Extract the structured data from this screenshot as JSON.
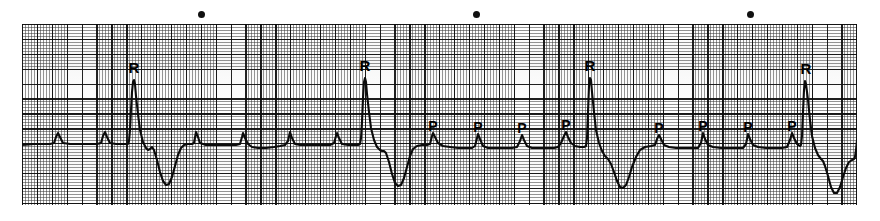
{
  "figure": {
    "kind": "ecg-rhythm-strip",
    "width": 880,
    "height": 221,
    "paper": {
      "x": 22,
      "y": 24,
      "width": 835,
      "height": 181
    },
    "trace_color": "#0b0b0b",
    "grid_fine_color": "#3c3c3c",
    "grid_bold_color": "#0a0a0a",
    "paper_color": "#ffffff",
    "baseline_y": 143,
    "small_square_px": 2.98,
    "large_square_px": 14.9
  },
  "timing_markers": [
    {
      "name": "timing-dot-1",
      "x": 201,
      "y": 14,
      "size": 7
    },
    {
      "name": "timing-dot-2",
      "x": 476,
      "y": 14,
      "size": 7
    },
    {
      "name": "timing-dot-3",
      "x": 750,
      "y": 14,
      "size": 7
    }
  ],
  "annotations": [
    {
      "id": "r1",
      "text": "R",
      "x": 134,
      "y": 60,
      "kind": "r-wave"
    },
    {
      "id": "r2",
      "text": "R",
      "x": 365,
      "y": 58,
      "kind": "r-wave"
    },
    {
      "id": "r3",
      "text": "R",
      "x": 590,
      "y": 58,
      "kind": "r-wave"
    },
    {
      "id": "r4",
      "text": "R",
      "x": 806,
      "y": 61,
      "kind": "r-wave"
    },
    {
      "id": "p1",
      "text": "P",
      "x": 433,
      "y": 119,
      "kind": "p-wave"
    },
    {
      "id": "p2",
      "text": "P",
      "x": 478,
      "y": 120,
      "kind": "p-wave"
    },
    {
      "id": "p3",
      "text": "P",
      "x": 522,
      "y": 121,
      "kind": "p-wave"
    },
    {
      "id": "p4",
      "text": "P",
      "x": 566,
      "y": 118,
      "kind": "p-wave"
    },
    {
      "id": "p5",
      "text": "P",
      "x": 659,
      "y": 121,
      "kind": "p-wave"
    },
    {
      "id": "p6",
      "text": "P",
      "x": 703,
      "y": 119,
      "kind": "p-wave"
    },
    {
      "id": "p7",
      "text": "P",
      "x": 748,
      "y": 120,
      "kind": "p-wave"
    },
    {
      "id": "p8",
      "text": "P",
      "x": 792,
      "y": 119,
      "kind": "p-wave"
    }
  ],
  "chart_data": {
    "type": "line",
    "title": "",
    "xlabel": "",
    "ylabel": "",
    "axis_units": {
      "x": "time (25 mm/s, 1 large square = 0.20 s)",
      "y": "voltage (10 mm/mV, 1 large square = 0.5 mV)"
    },
    "grid": true,
    "legend": false,
    "baseline_y_px": 143,
    "qrs_complexes": [
      {
        "label": "R",
        "x_px": 134,
        "r_peak_y_px": 80,
        "s_trough_y_px": 185
      },
      {
        "label": "R",
        "x_px": 364,
        "r_peak_y_px": 78,
        "s_trough_y_px": 186
      },
      {
        "label": "R",
        "x_px": 589,
        "r_peak_y_px": 78,
        "s_trough_y_px": 188
      },
      {
        "label": "R",
        "x_px": 805,
        "r_peak_y_px": 81,
        "s_trough_y_px": 193
      }
    ],
    "p_waves": [
      {
        "x_px": 58,
        "peak_y_px": 133,
        "labeled": false
      },
      {
        "x_px": 105,
        "peak_y_px": 133,
        "labeled": false
      },
      {
        "x_px": 196,
        "peak_y_px": 132,
        "labeled": false
      },
      {
        "x_px": 243,
        "peak_y_px": 133,
        "labeled": false
      },
      {
        "x_px": 290,
        "peak_y_px": 132,
        "labeled": false
      },
      {
        "x_px": 337,
        "peak_y_px": 133,
        "labeled": false
      },
      {
        "x_px": 433,
        "peak_y_px": 133,
        "labeled": true,
        "label": "P"
      },
      {
        "x_px": 478,
        "peak_y_px": 134,
        "labeled": true,
        "label": "P"
      },
      {
        "x_px": 522,
        "peak_y_px": 135,
        "labeled": true,
        "label": "P"
      },
      {
        "x_px": 566,
        "peak_y_px": 132,
        "labeled": true,
        "label": "P"
      },
      {
        "x_px": 659,
        "peak_y_px": 135,
        "labeled": true,
        "label": "P"
      },
      {
        "x_px": 703,
        "peak_y_px": 133,
        "labeled": true,
        "label": "P"
      },
      {
        "x_px": 748,
        "peak_y_px": 134,
        "labeled": true,
        "label": "P"
      },
      {
        "x_px": 792,
        "peak_y_px": 133,
        "labeled": true,
        "label": "P"
      }
    ],
    "trace_path": "M 22,145 L 34,144 L 44,144 L 50,144 L 54,143 L 56,137 L 58,133 L 60,137 L 63,143 L 70,144 L 80,144 L 90,144 L 97,144 L 101,143 L 103,136 L 105,132 L 107,137 L 110,143 L 116,144 L 122,144 L 126,144 L 128,144 L 129,141 L 130,130 L 131,110 L 132,92 L 133,82 L 134,80 L 135,84 L 136,96 L 138,114 L 140,130 L 143,142 L 146,148 L 148,150 L 150,149 L 152,147 L 154,150 L 157,160 L 160,172 L 163,181 L 166,185 L 169,184 L 172,177 L 175,166 L 178,155 L 181,148 L 184,145 L 188,144 L 192,144 L 194,143 L 196,132 L 198,137 L 200,143 L 206,145 L 214,145 L 222,145 L 230,145 L 236,145 L 240,144 L 242,137 L 243,133 L 245,138 L 248,144 L 252,147 L 258,148 L 266,148 L 274,147 L 280,146 L 285,145 L 288,141 L 290,132 L 292,138 L 295,144 L 300,145 L 308,145 L 316,145 L 324,145 L 330,145 L 334,143 L 336,136 L 337,133 L 339,138 L 342,144 L 348,145 L 354,145 L 358,145 L 360,144 L 361,138 L 362,122 L 363,98 L 364,82 L 365,78 L 366,82 L 367,94 L 369,112 L 371,128 L 374,140 L 377,147 L 380,150 L 382,151 L 384,151 L 386,153 L 389,162 L 392,174 L 395,183 L 398,186 L 401,185 L 404,178 L 407,167 L 410,156 L 413,149 L 417,146 L 422,145 L 427,145 L 430,144 L 432,136 L 433,133 L 435,137 L 438,143 L 443,146 L 450,147 L 458,148 L 466,148 L 472,148 L 475,146 L 477,138 L 478,134 L 480,139 L 483,146 L 488,148 L 496,148 L 504,148 L 512,148 L 517,147 L 520,141 L 522,135 L 524,140 L 527,146 L 532,148 L 540,148 L 548,148 L 554,148 L 558,147 L 561,143 L 564,136 L 566,132 L 568,137 L 571,143 L 575,146 L 580,147 L 584,147 L 586,146 L 587,138 L 588,112 L 589,86 L 590,78 L 591,80 L 592,92 L 594,112 L 596,130 L 599,143 L 602,151 L 605,156 L 608,159 L 611,164 L 614,172 L 617,181 L 620,187 L 623,188 L 626,185 L 629,177 L 632,167 L 636,157 L 640,150 L 645,147 L 651,146 L 655,145 L 657,139 L 659,135 L 661,139 L 664,145 L 669,147 L 676,148 L 684,148 L 692,148 L 698,148 L 701,143 L 703,133 L 705,139 L 708,145 L 713,147 L 721,148 L 729,148 L 737,148 L 743,148 L 746,144 L 748,134 L 750,139 L 753,145 L 758,147 L 766,148 L 774,148 L 782,148 L 787,147 L 790,140 L 792,133 L 794,138 L 797,144 L 800,146 L 801,145 L 802,136 L 803,112 L 804,90 L 805,81 L 806,84 L 808,100 L 810,120 L 812,136 L 815,148 L 818,155 L 821,159 L 823,161 L 825,166 L 828,176 L 831,187 L 834,193 L 837,193 L 840,187 L 843,177 L 846,168 L 849,162 L 852,160 L 854,159 L 855,157 L 856,150 L 857,140"
  }
}
